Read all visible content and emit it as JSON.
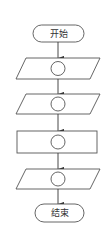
{
  "diagram": {
    "type": "flowchart",
    "start": {
      "label": "开始"
    },
    "end": {
      "label": "结束"
    },
    "steps": [
      {
        "shape": "parallelogram",
        "content": "circle"
      },
      {
        "shape": "parallelogram",
        "content": "circle"
      },
      {
        "shape": "rectangle",
        "content": "circle"
      },
      {
        "shape": "parallelogram",
        "content": "circle"
      }
    ],
    "colors": {
      "stroke": "#555555",
      "background": "#ffffff"
    }
  }
}
